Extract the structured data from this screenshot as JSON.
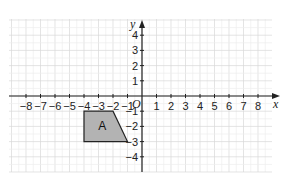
{
  "chart_data": {
    "type": "coordinate-grid",
    "title": "",
    "xlabel": "x",
    "ylabel": "y",
    "origin_label": "O",
    "xlim": [
      -9,
      9
    ],
    "ylim": [
      -5,
      5
    ],
    "x_ticks": [
      -8,
      -7,
      -6,
      -5,
      -4,
      -3,
      -2,
      -1,
      1,
      2,
      3,
      4,
      5,
      6,
      7,
      8
    ],
    "y_ticks": [
      4,
      3,
      2,
      1,
      -1,
      -2,
      -3,
      -4
    ],
    "grid": true,
    "shapes": [
      {
        "label": "A",
        "type": "trapezium",
        "vertices": [
          [
            -4,
            -1
          ],
          [
            -2,
            -1
          ],
          [
            -1,
            -3
          ],
          [
            -4,
            -3
          ]
        ],
        "fill": "#b3b3b3",
        "stroke": "#222222"
      }
    ]
  },
  "colors": {
    "grid_major": "#d9d9d9",
    "grid_minor": "#eeeeee",
    "axis": "#222222",
    "shape_fill": "#b3b3b3"
  }
}
